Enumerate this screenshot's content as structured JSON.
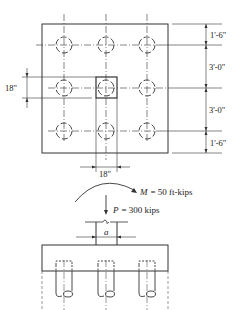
{
  "plan": {
    "dimensions_right": [
      "1'-6\"",
      "3'-0\"",
      "3'-0\"",
      "1'-6\""
    ],
    "column_width_left": "18\"",
    "column_width_bottom": "18\"",
    "pile_grid": {
      "rows": 3,
      "cols": 3
    }
  },
  "elevation": {
    "moment_label": "M = 50 ft-kips",
    "moment_symbol": "M",
    "moment_value": "= 50 ft-kips",
    "load_label": "P = 300 kips",
    "load_symbol": "P",
    "load_value": "= 300 kips",
    "column_dim_label": "a",
    "pile_count": 3
  },
  "colors": {
    "line": "#333333",
    "background": "#ffffff"
  }
}
